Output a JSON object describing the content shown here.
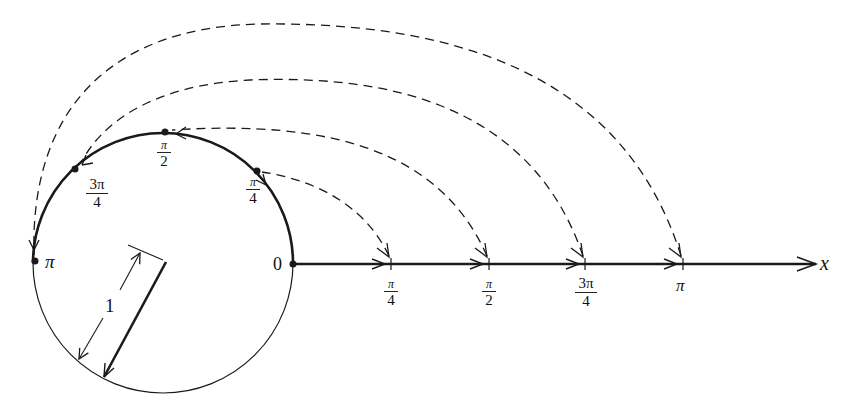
{
  "diagram": {
    "colors": {
      "ink": "#1a1a1a",
      "background": "#ffffff"
    },
    "circle": {
      "cx": 163,
      "cy": 263,
      "r": 130,
      "unit_label": "1"
    },
    "axis": {
      "y": 264,
      "x_start": 292,
      "x_end": 818,
      "label": "x"
    },
    "origin_label": "0",
    "axis_ticks": [
      {
        "x": 391,
        "num": "π",
        "den": "4",
        "id": "pi-over-4"
      },
      {
        "x": 489,
        "num": "π",
        "den": "2",
        "id": "pi-over-2"
      },
      {
        "x": 585,
        "num": "3π",
        "den": "4",
        "id": "three-pi-over-4"
      },
      {
        "x": 683,
        "num": "π",
        "den": "",
        "id": "pi"
      }
    ],
    "circle_points": [
      {
        "angle_deg": 45,
        "label_num": "π",
        "label_den": "4",
        "id": "pi-over-4"
      },
      {
        "angle_deg": 90,
        "label_num": "π",
        "label_den": "2",
        "id": "pi-over-2"
      },
      {
        "angle_deg": 135,
        "label_num": "3π",
        "label_den": "4",
        "id": "three-pi-over-4"
      },
      {
        "angle_deg": 180,
        "label_num": "π",
        "label_den": "",
        "id": "pi"
      }
    ],
    "mapping_arcs": [
      {
        "from": "π/4 on x-axis",
        "to": "π/4 on circle",
        "style": "dashed"
      },
      {
        "from": "π/2 on x-axis",
        "to": "π/2 on circle",
        "style": "dashed"
      },
      {
        "from": "3π/4 on x-axis",
        "to": "3π/4 on circle",
        "style": "dashed"
      },
      {
        "from": "π on x-axis",
        "to": "π on circle",
        "style": "dashed"
      }
    ]
  },
  "labels": {
    "origin": "0",
    "x_axis": "x",
    "radius": "1",
    "tick_pi4_num": "π",
    "tick_pi4_den": "4",
    "tick_pi2_num": "π",
    "tick_pi2_den": "2",
    "tick_3pi4_num": "3π",
    "tick_3pi4_den": "4",
    "tick_pi": "π",
    "circ_pi4_num": "π",
    "circ_pi4_den": "4",
    "circ_pi2_num": "π",
    "circ_pi2_den": "2",
    "circ_3pi4_num": "3π",
    "circ_3pi4_den": "4",
    "circ_pi": "π"
  }
}
